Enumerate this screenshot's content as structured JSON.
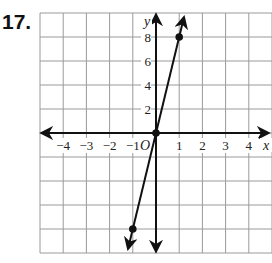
{
  "problem": {
    "number": "17."
  },
  "chart_data": {
    "type": "line",
    "title": "",
    "xlabel": "x",
    "ylabel": "y",
    "origin_label": "O",
    "xlim": [
      -5,
      5
    ],
    "ylim": [
      -10,
      10
    ],
    "grid": true,
    "x_tick_labels": [
      "-4",
      "-3",
      "-2",
      "-1",
      "1",
      "2",
      "3",
      "4"
    ],
    "y_tick_labels": [
      "2",
      "4",
      "6",
      "8"
    ],
    "series": [
      {
        "name": "y = 8x",
        "equation": "y = 8x",
        "points": [
          {
            "x": -1,
            "y": -8
          },
          {
            "x": 0,
            "y": 0
          },
          {
            "x": 1,
            "y": 8
          }
        ]
      }
    ],
    "colors": {
      "grid": "#9a9a9a",
      "axes": "#111111",
      "line": "#111111"
    }
  }
}
